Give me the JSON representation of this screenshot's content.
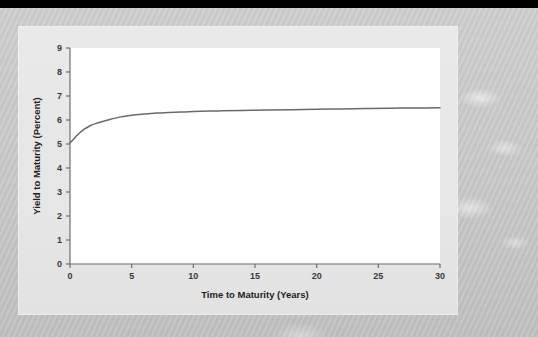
{
  "figure": {
    "panel_bg": "#e7e7e7",
    "plot_bg": "#ffffff",
    "axis_color": "#6e6e6e",
    "line_color": "#6a6a6a",
    "text_color": "#2e2e2e"
  },
  "chart_data": {
    "type": "line",
    "title": "",
    "xlabel": "Time to Maturity (Years)",
    "ylabel": "Yield to Maturity (Percent)",
    "xlim": [
      0,
      30
    ],
    "ylim": [
      0,
      9
    ],
    "xticks": [
      "0",
      "5",
      "10",
      "15",
      "20",
      "25",
      "30"
    ],
    "yticks": [
      "0",
      "1",
      "2",
      "3",
      "4",
      "5",
      "6",
      "7",
      "8",
      "9"
    ],
    "grid": false,
    "legend": "none",
    "series": [
      {
        "name": "Yield curve",
        "color": "#6a6a6a",
        "x": [
          0,
          0.25,
          0.5,
          0.75,
          1,
          1.25,
          1.5,
          1.75,
          2,
          2.5,
          3,
          4,
          5,
          6,
          7,
          8,
          9,
          10,
          12,
          14,
          16,
          18,
          20,
          22,
          24,
          26,
          28,
          30
        ],
        "values": [
          5.05,
          5.18,
          5.32,
          5.45,
          5.56,
          5.65,
          5.72,
          5.79,
          5.84,
          5.92,
          5.99,
          6.12,
          6.2,
          6.25,
          6.29,
          6.31,
          6.33,
          6.35,
          6.38,
          6.4,
          6.42,
          6.43,
          6.45,
          6.46,
          6.48,
          6.49,
          6.5,
          6.51
        ]
      }
    ]
  }
}
